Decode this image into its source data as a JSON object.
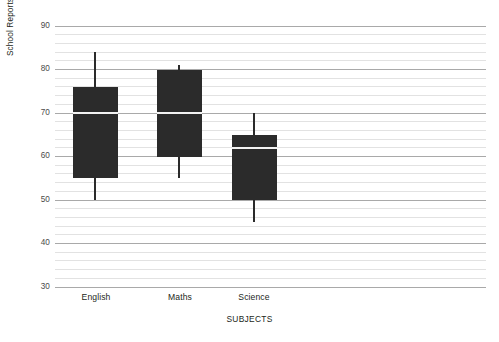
{
  "chart_data": {
    "type": "box",
    "title": "",
    "xlabel": "SUBJECTS",
    "ylabel": "School Reports - Percentage %",
    "categories": [
      "English",
      "Maths",
      "Science"
    ],
    "ylim": [
      30,
      90
    ],
    "ytick_labels": [
      "30",
      "40",
      "50",
      "60",
      "70",
      "80",
      "90"
    ],
    "ytick_values": [
      30,
      40,
      50,
      60,
      70,
      80,
      90
    ],
    "minor_tick_step": 2,
    "grid": true,
    "grid_major_color": "#a9a9a9",
    "grid_minor_color": "#e2e2e2",
    "box_fill": "#2b2b2b",
    "whisker_color": "#2b2b2b",
    "median_color": "#f2f2f2",
    "legend": "none",
    "boxes": [
      {
        "category": "English",
        "min": 50,
        "q1": 55,
        "median": 70,
        "q3": 76,
        "max": 84
      },
      {
        "category": "Maths",
        "min": 55,
        "q1": 60,
        "median": 70,
        "q3": 80,
        "max": 81
      },
      {
        "category": "Science",
        "min": 45,
        "q1": 50,
        "median": 62,
        "q3": 65,
        "max": 70
      }
    ]
  },
  "labels": {
    "y_axis_title": "School Reports - Percentage %",
    "x_axis_title": "SUBJECTS",
    "ytick_30": "30",
    "ytick_40": "40",
    "ytick_50": "50",
    "ytick_60": "60",
    "ytick_70": "70",
    "ytick_80": "80",
    "ytick_90": "90",
    "xtick_english": "English",
    "xtick_maths": "Maths",
    "xtick_science": "Science"
  }
}
